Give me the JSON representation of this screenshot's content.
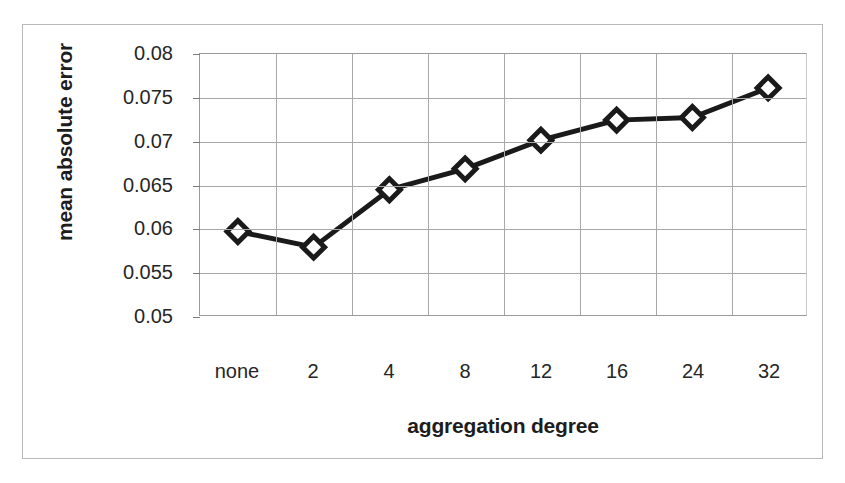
{
  "chart_data": {
    "type": "line",
    "title": "",
    "subtitle": "",
    "xlabel": "aggregation degree",
    "ylabel": "mean absolute error",
    "categories": [
      "none",
      "2",
      "4",
      "8",
      "12",
      "16",
      "24",
      "32"
    ],
    "values": [
      0.0596,
      0.0578,
      0.0644,
      0.0668,
      0.0701,
      0.0724,
      0.0727,
      0.0761
    ],
    "series": [
      {
        "name": "mean absolute error",
        "values": [
          0.0596,
          0.0578,
          0.0644,
          0.0668,
          0.0701,
          0.0724,
          0.0727,
          0.0761
        ]
      }
    ],
    "ylim": [
      0.05,
      0.08
    ],
    "ytick_values": [
      0.08,
      0.075,
      0.07,
      0.065,
      0.06,
      0.055,
      0.05
    ],
    "ytick_labels": [
      "0.08",
      "0.075",
      "0.07",
      "0.065",
      "0.06",
      "0.055",
      "0.05"
    ],
    "xtick_labels": [
      "none",
      "2",
      "4",
      "8",
      "12",
      "16",
      "24",
      "32"
    ],
    "grid": "horizontal-and-vertical",
    "legend": "none",
    "legend_position": "none",
    "marker": "diamond-open",
    "line_color": "#1a1a1a",
    "marker_fill": "#ffffff",
    "marker_stroke": "#1a1a1a",
    "grid_color": "#a8a8a8",
    "frame_color": "#b9b9b9",
    "background_color": "#ffffff",
    "annotations": []
  }
}
